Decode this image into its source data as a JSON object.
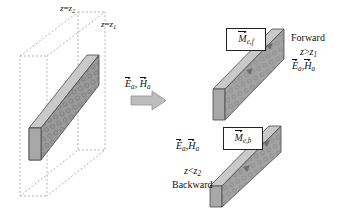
{
  "figure": {
    "type": "technical-diagram",
    "background_color": "#ffffff",
    "ink_color": "#111111"
  },
  "colors": {
    "slab_front": "#9a9a9a",
    "slab_top": "#c9c9c9",
    "slab_side": "#b4b4b4",
    "slab_edge": "#4a4a4a",
    "dashed_line": "#9aa0a6",
    "arrow_fill": "#bdbdbd",
    "arrow_edge": "#8a8a8a",
    "box_border": "#222222"
  },
  "left_panel": {
    "name": "original-slab-between-planes",
    "plane_labels": [
      {
        "id": "plane-z2",
        "base": "z",
        "eq": "=",
        "var": "z",
        "sub": "2",
        "text": "z=z2"
      },
      {
        "id": "plane-z1",
        "base": "z",
        "eq": "=",
        "var": "z",
        "sub": "1",
        "text": "z=z1"
      }
    ],
    "slab": {
      "label": "dielectric-slab",
      "texture": "hatched"
    }
  },
  "middle": {
    "fields_label": {
      "E": "E",
      "H": "H",
      "sub": "a",
      "text": "Ea, Ha"
    },
    "arrow": {
      "name": "transform-arrow",
      "direction": "right"
    }
  },
  "forward_panel": {
    "name": "forward-equivalent-source",
    "source_box": {
      "symbol": "M",
      "sub": "e,f",
      "text": "Me,f"
    },
    "caption": "Forward",
    "region": {
      "var": "z",
      "rel": ">",
      "bound": "z",
      "sub": "1",
      "text": "z>z1"
    },
    "fields_label": {
      "E": "E",
      "H": "H",
      "sub": "a",
      "text": "Ea,Ha"
    }
  },
  "backward_panel": {
    "name": "backward-equivalent-source",
    "source_box": {
      "symbol": "M",
      "sub": "e,b",
      "text": "Me,b"
    },
    "caption": "Backward",
    "region": {
      "var": "z",
      "rel": "<",
      "bound": "z",
      "sub": "2",
      "text": "z<z2"
    },
    "fields_label": {
      "E": "E",
      "H": "H",
      "sub": "a",
      "text": "Ea,Ha"
    }
  }
}
